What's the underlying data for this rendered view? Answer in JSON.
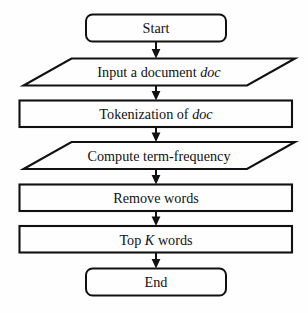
{
  "diagram": {
    "background_color": "#fefefe",
    "stroke_color": "#111111",
    "nodes": [
      {
        "id": "start",
        "shape": "terminator",
        "label": "Start",
        "label_plain": "Start",
        "italic_part": ""
      },
      {
        "id": "input-document",
        "shape": "parallelogram",
        "label": "Input a document doc",
        "label_prefix": "Input a document ",
        "italic_part": "doc",
        "label_suffix": ""
      },
      {
        "id": "tokenization",
        "shape": "rectangle",
        "label": "Tokenization of doc",
        "label_prefix": "Tokenization of ",
        "italic_part": "doc",
        "label_suffix": ""
      },
      {
        "id": "compute-term-frequency",
        "shape": "parallelogram",
        "label": "Compute term-frequency",
        "label_prefix": "Compute term-frequency",
        "italic_part": "",
        "label_suffix": ""
      },
      {
        "id": "remove-words",
        "shape": "rectangle",
        "label": "Remove words",
        "label_prefix": "Remove words",
        "italic_part": "",
        "label_suffix": ""
      },
      {
        "id": "top-k-words",
        "shape": "rectangle",
        "label": "Top K words",
        "label_prefix": "Top ",
        "italic_part": "K",
        "label_suffix": " words"
      },
      {
        "id": "end",
        "shape": "terminator",
        "label": "End",
        "label_plain": "End",
        "italic_part": ""
      }
    ],
    "edges": [
      {
        "from": "start",
        "to": "input-document",
        "arrow": "down"
      },
      {
        "from": "input-document",
        "to": "tokenization",
        "arrow": "down"
      },
      {
        "from": "tokenization",
        "to": "compute-term-frequency",
        "arrow": "down"
      },
      {
        "from": "compute-term-frequency",
        "to": "remove-words",
        "arrow": "down"
      },
      {
        "from": "remove-words",
        "to": "top-k-words",
        "arrow": "down"
      },
      {
        "from": "top-k-words",
        "to": "end",
        "arrow": "down"
      }
    ]
  }
}
